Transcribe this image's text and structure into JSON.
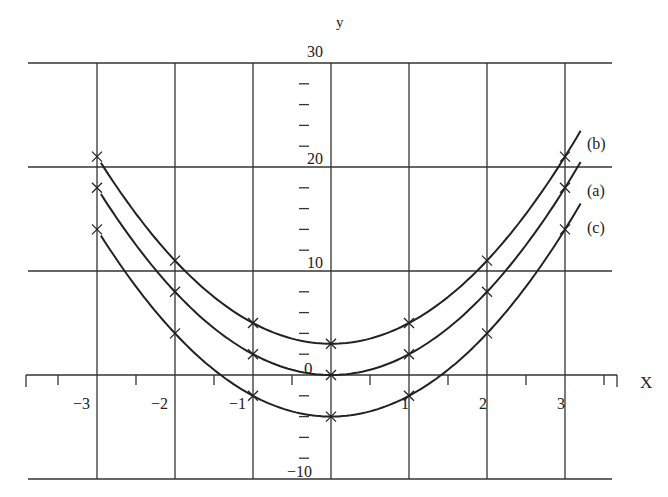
{
  "chart_data": {
    "type": "line",
    "title": "",
    "xlabel": "X",
    "ylabel": "y",
    "xlim": [
      -3.7,
      3.7
    ],
    "ylim": [
      -10,
      30
    ],
    "grid": true,
    "x_ticks": [
      -3,
      -2,
      -1,
      1,
      2,
      3
    ],
    "x_tick_labels": [
      "−3",
      "−2",
      "−1",
      "1",
      "2",
      "3"
    ],
    "y_ticks": [
      -10,
      0,
      10,
      20,
      30
    ],
    "y_tick_labels": [
      "−10",
      "0",
      "10",
      "20",
      "30"
    ],
    "x": [
      -3,
      -2,
      -1,
      0,
      1,
      2,
      3
    ],
    "series": [
      {
        "name": "(a)",
        "equation": "y = 2x²",
        "values": [
          18,
          8,
          2,
          0,
          2,
          8,
          18
        ]
      },
      {
        "name": "(b)",
        "equation": "y = 2x² + 3",
        "values": [
          21,
          11,
          5,
          3,
          5,
          11,
          21
        ]
      },
      {
        "name": "(c)",
        "equation": "y = 2x² − 4",
        "values": [
          14,
          4,
          -2,
          -4,
          -2,
          4,
          14
        ]
      }
    ],
    "marker": "x",
    "legend_position": "right (inline labels)"
  },
  "labels": {
    "x_axis": "X",
    "y_axis": "y",
    "origin": "0",
    "curve_b": "(b)",
    "curve_a": "(a)",
    "curve_c": "(c)"
  },
  "style": {
    "line_color": "#222222",
    "grid_color": "#333333",
    "background": "#ffffff"
  }
}
